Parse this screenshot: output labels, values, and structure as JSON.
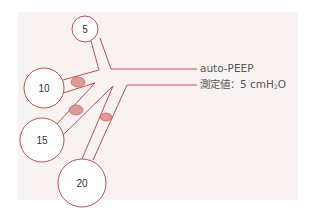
{
  "diagram": {
    "colors": {
      "line": "#c0504d",
      "obstruction_fill": "#d98f8b",
      "panel_bg": "#f8f3f2",
      "circle_fill": "#ffffff",
      "label_text": "#333333",
      "annotation_text": "#555555"
    },
    "alveoli": [
      {
        "id": "alveolus-5",
        "label": "5",
        "cx": 85,
        "cy": 29,
        "r": 13
      },
      {
        "id": "alveolus-10",
        "label": "10",
        "cx": 44,
        "cy": 88,
        "r": 20
      },
      {
        "id": "alveolus-15",
        "label": "15",
        "cx": 42,
        "cy": 140,
        "r": 22
      },
      {
        "id": "alveolus-20",
        "label": "20",
        "cx": 82,
        "cy": 183,
        "r": 24
      }
    ],
    "obstructions": [
      {
        "id": "obstruction-branch-10",
        "cx": 78,
        "cy": 82,
        "rx": 7,
        "ry": 5
      },
      {
        "id": "obstruction-branch-15",
        "cx": 76,
        "cy": 110,
        "rx": 7,
        "ry": 5
      },
      {
        "id": "obstruction-branch-20",
        "cx": 106,
        "cy": 117,
        "rx": 6,
        "ry": 4
      }
    ],
    "annotation": {
      "line1": "auto-PEEP",
      "line2_prefix": "測定値：5 cmH",
      "line2_sub": "2",
      "line2_suffix": "O"
    }
  }
}
